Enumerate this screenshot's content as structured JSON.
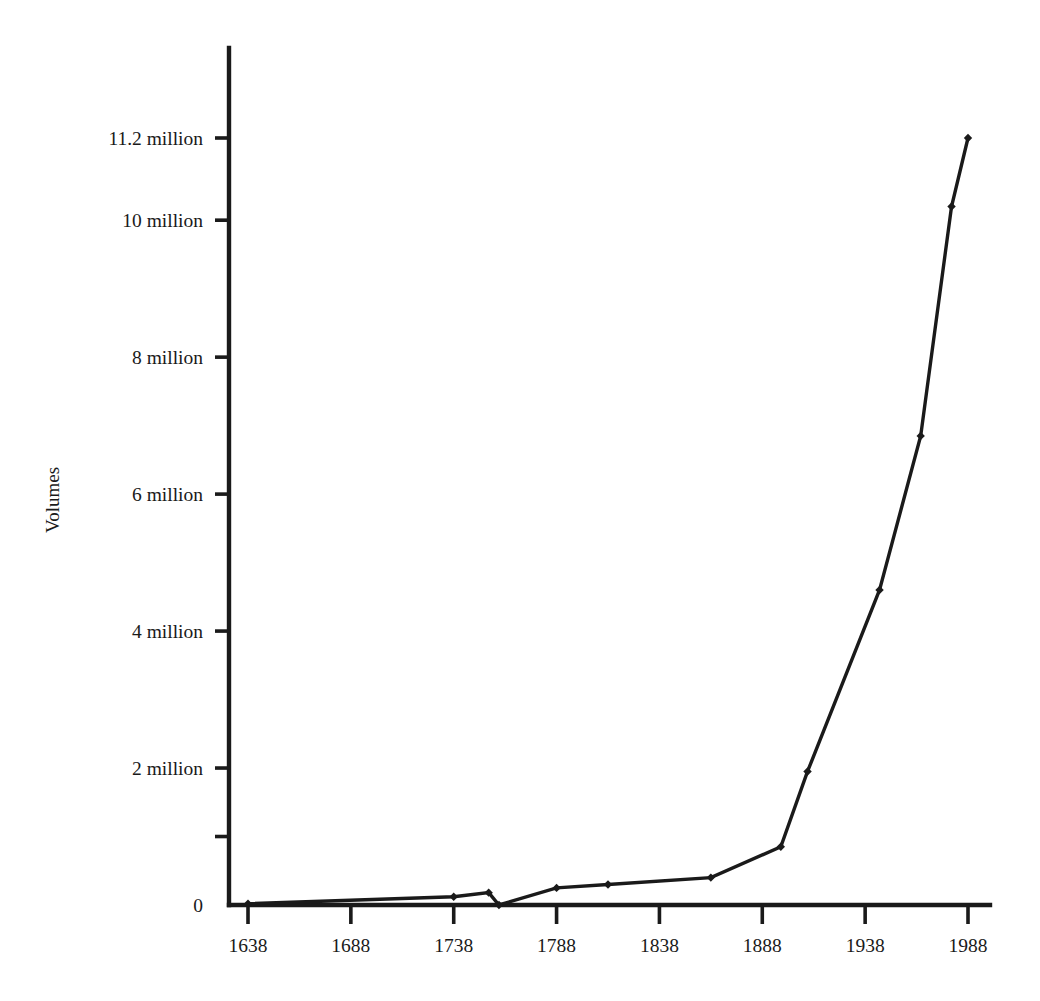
{
  "chart_data": {
    "type": "line",
    "title": "",
    "subtitle": "",
    "xlabel": "",
    "ylabel": "Volumes",
    "xlim": [
      1613,
      2000
    ],
    "ylim": [
      0,
      11200000
    ],
    "grid": false,
    "legend_position": "none",
    "legend_entries": [],
    "annotations": [],
    "x_tick_labels": [
      "1638",
      "1688",
      "1738",
      "1788",
      "1838",
      "1888",
      "1938",
      "1988"
    ],
    "x_ticks": [
      1638,
      1688,
      1738,
      1788,
      1838,
      1888,
      1938,
      1988
    ],
    "y_tick_labels": [
      "0",
      "",
      "2 million",
      "4 million",
      "6 million",
      "8 million",
      "10 million",
      "11.2 million"
    ],
    "y_ticks": [
      0,
      1000000,
      2000000,
      4000000,
      6000000,
      8000000,
      10000000,
      11200000
    ],
    "series": [
      {
        "name": "Volumes",
        "marker": "diamond",
        "color": "#1a1a1a",
        "x": [
          1638,
          1738,
          1755,
          1760,
          1788,
          1813,
          1863,
          1897,
          1910,
          1945,
          1965,
          1980,
          1988
        ],
        "values": [
          20000,
          120000,
          180000,
          0,
          250000,
          300000,
          400000,
          850000,
          1950000,
          4600000,
          6850000,
          10200000,
          11200000
        ]
      }
    ]
  },
  "axis": {
    "y_title": "Volumes"
  },
  "colors": {
    "ink": "#1a1a1a",
    "background": "#ffffff"
  }
}
